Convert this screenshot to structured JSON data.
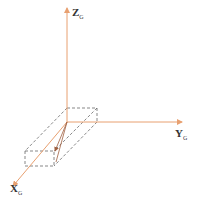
{
  "diagram": {
    "title": "",
    "axis_color": "#e8a070",
    "box_color": "#555555",
    "axes": {
      "z": {
        "label": "Z",
        "sub": "G"
      },
      "y": {
        "label": "Y",
        "sub": "G"
      },
      "x": {
        "label": "X",
        "sub": "G"
      }
    }
  }
}
